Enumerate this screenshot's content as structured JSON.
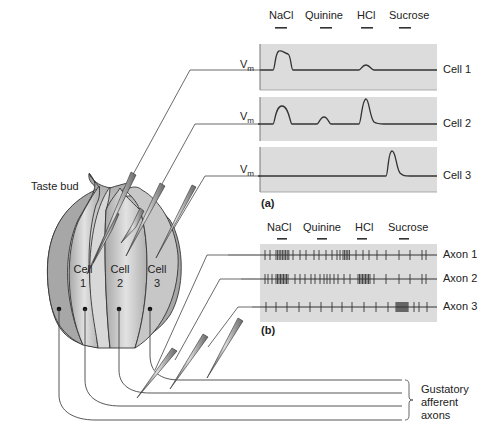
{
  "figure": {
    "taste_bud_label": "Taste bud",
    "cells": [
      {
        "label": "Cell",
        "number": "1"
      },
      {
        "label": "Cell",
        "number": "2"
      },
      {
        "label": "Cell",
        "number": "3"
      }
    ],
    "afferent_label_lines": [
      "Gustatory",
      "afferent",
      "axons"
    ]
  },
  "panel_a": {
    "letter": "(a)",
    "stimuli": [
      "NaCl",
      "Quinine",
      "HCl",
      "Sucrose"
    ],
    "vm_label": "V",
    "vm_sub": "m",
    "traces": [
      {
        "label": "Cell 1"
      },
      {
        "label": "Cell 2"
      },
      {
        "label": "Cell 3"
      }
    ]
  },
  "panel_b": {
    "letter": "(b)",
    "stimuli": [
      "NaCl",
      "Quinine",
      "HCl",
      "Sucrose"
    ],
    "rows": [
      {
        "label": "Axon 1"
      },
      {
        "label": "Axon 2"
      },
      {
        "label": "Axon 3"
      }
    ]
  },
  "colors": {
    "panel_bg": "#dcdcdc",
    "trace": "#333333",
    "cell_fill": "#b5b5b5",
    "cell_highlight": "#e6e6e6",
    "outline": "#333333"
  }
}
